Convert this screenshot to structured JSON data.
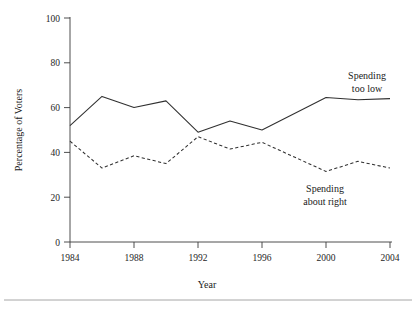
{
  "chart_data": {
    "type": "line",
    "title": "",
    "subtitle": "",
    "xlabel": "Year",
    "ylabel": "Percentage of Voters",
    "xlim": [
      1984,
      2004
    ],
    "ylim": [
      0,
      100
    ],
    "xticks": [
      1984,
      1988,
      1992,
      1996,
      2000,
      2004
    ],
    "xtick_labels": [
      "1984",
      "1988",
      "1992",
      "1996",
      "2000",
      "2004"
    ],
    "yticks": [
      0,
      20,
      40,
      60,
      80,
      100
    ],
    "ytick_labels": [
      "0",
      "20",
      "40",
      "60",
      "80",
      "100"
    ],
    "grid": false,
    "legend_position": "inline-annotations",
    "x": [
      1984,
      1986,
      1988,
      1990,
      1992,
      1994,
      1996,
      2000,
      2002,
      2004
    ],
    "series": [
      {
        "name": "Spending too low",
        "style": "solid",
        "color": "#303030",
        "values": [
          52,
          65,
          60,
          63,
          49,
          54,
          50,
          64.5,
          63.5,
          64
        ],
        "annotation": "Spending too low",
        "annotation_lines": [
          "Spending",
          "too low"
        ]
      },
      {
        "name": "Spending about right",
        "style": "dashed",
        "color": "#303030",
        "values": [
          45,
          33,
          38.5,
          35,
          47,
          41.5,
          44.5,
          31.5,
          36,
          33
        ],
        "annotation": "Spending about right",
        "annotation_lines": [
          "Spending",
          "about right"
        ]
      }
    ]
  },
  "figure": {
    "axis_color": "#3a3a3a",
    "background": "#ffffff",
    "footer_rule_color": "#8f8f8f"
  }
}
